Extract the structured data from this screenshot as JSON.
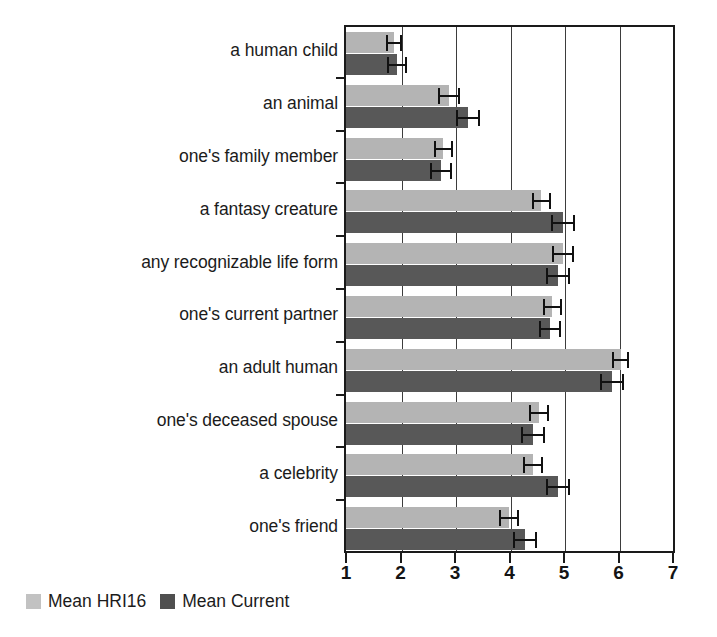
{
  "chart_data": {
    "type": "bar",
    "orientation": "horizontal",
    "title": "",
    "xlabel": "",
    "ylabel": "",
    "xlim": [
      1,
      7
    ],
    "xticks": [
      1,
      2,
      3,
      4,
      5,
      6,
      7
    ],
    "xtick_labels": [
      "1",
      "2",
      "3",
      "4",
      "5",
      "6",
      "7"
    ],
    "grid": true,
    "grid_axis": "x",
    "legend_position": "below-left",
    "categories": [
      "a human child",
      "an animal",
      "one's family member",
      "a fantasy creature",
      "any recognizable life form",
      "one's current partner",
      "an adult human",
      "one's deceased spouse",
      "a celebrity",
      "one's friend"
    ],
    "series": [
      {
        "name": "Mean HRI16",
        "color": "#b4b4b4",
        "values": [
          1.85,
          2.85,
          2.75,
          4.55,
          4.95,
          4.75,
          6.0,
          4.5,
          4.4,
          3.95
        ],
        "errors": [
          0.15,
          0.2,
          0.18,
          0.18,
          0.2,
          0.18,
          0.15,
          0.18,
          0.18,
          0.18
        ]
      },
      {
        "name": "Mean Current",
        "color": "#585858",
        "values": [
          1.9,
          3.2,
          2.7,
          4.95,
          4.85,
          4.7,
          5.85,
          4.4,
          4.85,
          4.25
        ],
        "errors": [
          0.18,
          0.22,
          0.2,
          0.22,
          0.22,
          0.2,
          0.22,
          0.22,
          0.22,
          0.22
        ]
      }
    ]
  },
  "legend": {
    "items": [
      {
        "label": "Mean HRI16",
        "color": "#c2c2c2"
      },
      {
        "label": "Mean Current",
        "color": "#4f4f4f"
      }
    ]
  }
}
